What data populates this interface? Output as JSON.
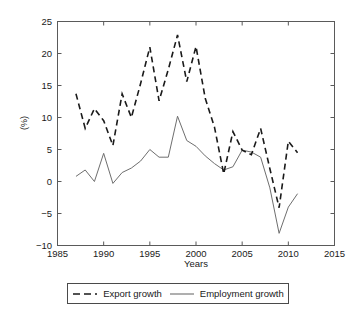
{
  "chart_data": {
    "type": "line",
    "title": "",
    "xlabel": "Years",
    "ylabel": "(%)",
    "xlim": [
      1985,
      2015
    ],
    "ylim": [
      -10,
      25
    ],
    "xticks": [
      1985,
      1990,
      1995,
      2000,
      2005,
      2010,
      2015
    ],
    "yticks": [
      -10,
      -5,
      0,
      5,
      10,
      15,
      20,
      25
    ],
    "grid": false,
    "legend_position": "bottom-center",
    "x": [
      1987,
      1988,
      1989,
      1990,
      1991,
      1992,
      1993,
      1994,
      1995,
      1996,
      1997,
      1998,
      1999,
      2000,
      2001,
      2002,
      2003,
      2004,
      2005,
      2006,
      2007,
      2008,
      2009,
      2010,
      2011
    ],
    "series": [
      {
        "name": "Export growth",
        "style": "dashed",
        "color": "#1a1a1a",
        "values": [
          13.7,
          8.3,
          11.4,
          9.5,
          5.6,
          13.7,
          10.0,
          15.3,
          21.0,
          12.6,
          17.5,
          22.9,
          15.6,
          21.1,
          13.0,
          8.5,
          1.2,
          7.8,
          4.9,
          4.2,
          8.3,
          2.0,
          -4.1,
          6.3,
          4.5
        ]
      },
      {
        "name": "Employment growth",
        "style": "solid",
        "color": "#6e6e6e",
        "values": [
          0.8,
          1.8,
          0.0,
          4.4,
          -0.3,
          1.4,
          2.1,
          3.2,
          5.0,
          3.8,
          3.8,
          10.2,
          6.4,
          5.5,
          4.0,
          2.8,
          1.8,
          2.3,
          4.9,
          4.6,
          3.8,
          -1.0,
          -8.1,
          -4.0,
          -1.9
        ]
      }
    ]
  },
  "ticks": {
    "x": [
      "1985",
      "1990",
      "1995",
      "2000",
      "2005",
      "2010",
      "2015"
    ],
    "y": [
      "25",
      "20",
      "15",
      "10",
      "5",
      "0",
      "−5",
      "−10"
    ]
  },
  "labels": {
    "x_axis": "Years",
    "y_axis": "(%)"
  },
  "legend": {
    "items": [
      {
        "label": "Export growth"
      },
      {
        "label": "Employment growth"
      }
    ]
  }
}
